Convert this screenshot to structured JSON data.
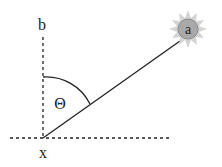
{
  "labels": {
    "vertical_axis": "b",
    "origin": "x",
    "angle": "Θ",
    "sun": "a"
  },
  "colors": {
    "stroke": "#222222",
    "sun_rays": "#cfcfcf",
    "sun_body": "#a8a8a8",
    "sun_ring": "#8a8a8a"
  }
}
